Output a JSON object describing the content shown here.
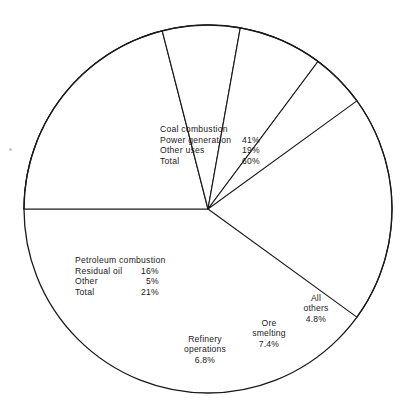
{
  "figure": {
    "title": "",
    "background_color": "#ffffff",
    "line_color": "#1a1a1a"
  },
  "chart_data": {
    "type": "pie",
    "title": "",
    "xlabel": "",
    "ylabel": "",
    "legend_position": "inside-slices",
    "grid": false,
    "units": "percent",
    "center": {
      "x": 208,
      "y": 209
    },
    "radius": 184,
    "start_angle_deg": 180,
    "direction": "clockwise",
    "categories": [
      "Coal combustion",
      "Petroleum combustion",
      "Refinery operations",
      "Ore smelting",
      "All others"
    ],
    "values": [
      60,
      21,
      6.8,
      7.4,
      4.8
    ],
    "slices": [
      {
        "name": "Coal combustion",
        "value": 60,
        "value_text": "60%",
        "start_deg": 180,
        "sweep_deg": 216,
        "subitems": [
          {
            "label": "Power generation",
            "value": 41,
            "value_text": "41%"
          },
          {
            "label": "Other uses",
            "value": 19,
            "value_text": "19%"
          }
        ]
      },
      {
        "name": "Petroleum combustion",
        "value": 21,
        "value_text": "21%",
        "start_deg": 180,
        "sweep_deg": 75.6,
        "subitems": [
          {
            "label": "Residual oil",
            "value": 16,
            "value_text": "16%"
          },
          {
            "label": "Other",
            "value": 5,
            "value_text": "5%"
          }
        ]
      },
      {
        "name": "Refinery operations",
        "value": 6.8,
        "value_text": "6.8%",
        "start_deg": 255.6,
        "sweep_deg": 24.5,
        "subitems": []
      },
      {
        "name": "Ore smelting",
        "value": 7.4,
        "value_text": "7.4%",
        "start_deg": 280.1,
        "sweep_deg": 26.6,
        "subitems": []
      },
      {
        "name": "All others",
        "value": 4.8,
        "value_text": "4.8%",
        "start_deg": 306.7,
        "sweep_deg": 17.3,
        "subitems": []
      }
    ]
  },
  "coal_callout": {
    "heading": "Coal combustion",
    "rows": [
      {
        "label": "Power generation",
        "value": "41%"
      },
      {
        "label": "Other uses",
        "value": "19%"
      },
      {
        "label": "Total",
        "value": "60%"
      }
    ]
  },
  "petroleum_callout": {
    "heading": "Petroleum combustion",
    "rows": [
      {
        "label": "Residual oil",
        "value": "16%"
      },
      {
        "label": "Other",
        "value": "5%"
      },
      {
        "label": "Total",
        "value": "21%"
      }
    ]
  },
  "wedge_labels": {
    "refinery": {
      "line1": "Refinery",
      "line2": "operations",
      "line3": "6.8%"
    },
    "ore": {
      "line1": "Ore",
      "line2": "smelting",
      "line3": "7.4%"
    },
    "others": {
      "line1": "All",
      "line2": "others",
      "line3": "4.8%"
    }
  }
}
